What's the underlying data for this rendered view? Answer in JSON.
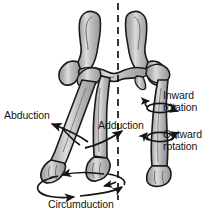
{
  "figure": {
    "background_color": "#ffffff",
    "ink_color": "#151515",
    "bone_fill": "#a8a8a8",
    "bone_highlight": "#d4d4d4",
    "bone_outline": "#1a1a1a"
  },
  "labels": {
    "abduction": "Abduction",
    "adduction": "Adduction",
    "inward_rotation_line1": "Inward",
    "inward_rotation_line2": "rotation",
    "outward_rotation_line1": "Outward",
    "outward_rotation_line2": "rotation",
    "circumduction": "Circumduction"
  },
  "anatomy": {
    "pelvis": "pelvis-bone",
    "left_femur_abducted": "left-femur-abducted",
    "left_femur_adducted": "left-femur-adducted",
    "right_femur": "right-femur",
    "midline": "vertical-dashed-midline"
  },
  "annotations": {
    "abduction_arrow": "arc-arrow-outward-left",
    "adduction_arrow": "arc-arrow-inward-right",
    "inward_rotation_arrow": "circular-arrow-inward",
    "outward_rotation_arrow": "circular-arrow-outward",
    "circumduction_arrow": "ellipse-arrow-circular-path"
  }
}
